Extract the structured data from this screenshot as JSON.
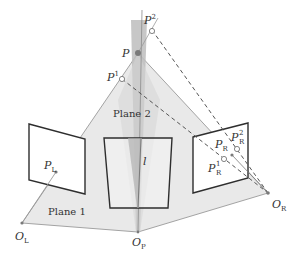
{
  "figure": {
    "type": "epipolar-geometry-diagram",
    "colors": {
      "plane_fill": "#e9e9e9",
      "plane_edge": "#9a9a9a",
      "wedge_fill": "#b9b9b9",
      "image_frame": "#2e2e2e",
      "image_fill": "#ffffff",
      "dashed_line": "#555555",
      "point": "#7a7a7a",
      "text": "#333333"
    }
  },
  "labels": {
    "P": "P",
    "P1_base": "P",
    "P1_sup": "1",
    "P2_base": "P",
    "P2_sup": "2",
    "PL_base": "P",
    "PL_sub": "L",
    "PR_base": "P",
    "PR_sub": "R",
    "PR1_base": "P",
    "PR1_sup": "1",
    "PR1_sub": "R",
    "PR2_base": "P",
    "PR2_sup": "2",
    "PR2_sub": "R",
    "OL_base": "O",
    "OL_sub": "L",
    "OP_base": "O",
    "OP_sub": "P",
    "OR_base": "O",
    "OR_sub": "R",
    "line_l": "l",
    "plane1": "Plane 1",
    "plane2": "Plane 2"
  }
}
